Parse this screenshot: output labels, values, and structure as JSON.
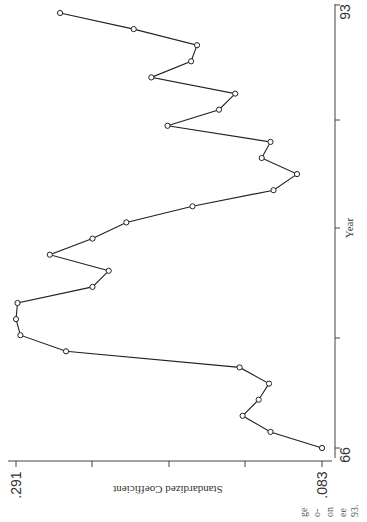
{
  "chart_data": {
    "type": "line",
    "title": "",
    "xlabel": "Year",
    "ylabel": "Standardized Coefficient",
    "orientation": "rotated-90",
    "xlim": [
      66,
      93
    ],
    "ylim": [
      0.083,
      0.291
    ],
    "x_tick_labels": [
      "66",
      "93"
    ],
    "y_tick_labels": [
      ".291",
      ".083"
    ],
    "grid": false,
    "legend": null,
    "markers": "open-circle",
    "x": [
      66,
      67,
      68,
      69,
      70,
      71,
      72,
      73,
      74,
      75,
      76,
      77,
      78,
      79,
      80,
      81,
      82,
      83,
      84,
      85,
      86,
      87,
      88,
      89,
      90,
      91,
      92,
      93
    ],
    "values": [
      0.083,
      0.118,
      0.137,
      0.126,
      0.119,
      0.139,
      0.257,
      0.288,
      0.291,
      0.29,
      0.239,
      0.228,
      0.268,
      0.239,
      0.216,
      0.171,
      0.116,
      0.1,
      0.124,
      0.118,
      0.188,
      0.153,
      0.142,
      0.199,
      0.172,
      0.168,
      0.211,
      0.261
    ]
  },
  "labels": {
    "year_axis_title": "Year",
    "coef_axis_title": "Standardized Coefficient",
    "year_min": "66",
    "year_max": "93",
    "coef_max": ".291",
    "coef_min": ".083"
  },
  "margin_fragments": [
    "ge",
    "o-",
    "on",
    "ee",
    "93."
  ]
}
